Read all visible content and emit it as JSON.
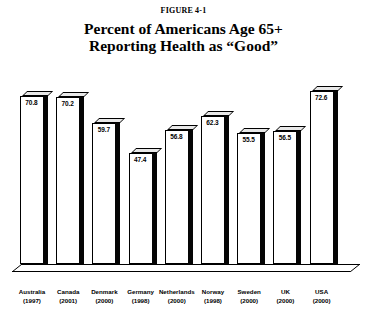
{
  "figure": {
    "caption": "FIGURE 4-1"
  },
  "title": {
    "line1": "Percent of Americans Age 65+",
    "line2": "Reporting Health as “Good”"
  },
  "chart_data": {
    "type": "bar",
    "title": "Percent of Americans Age 65+ Reporting Health as “Good”",
    "subtitle": "FIGURE 4-1",
    "xlabel": "",
    "ylabel": "",
    "ylim": [
      0,
      80
    ],
    "grid": false,
    "legend": "none",
    "value_labels": true,
    "categories": [
      "Australia (1997)",
      "Canada (2001)",
      "Denmark (2000)",
      "Germany (1998)",
      "Netherlands (2000)",
      "Norway (1998)",
      "Sweden (2000)",
      "UK (2000)",
      "USA (2000)"
    ],
    "values": [
      70.8,
      70.2,
      59.7,
      47.4,
      56.8,
      62.3,
      55.5,
      56.5,
      72.6
    ],
    "points": [
      {
        "country": "Australia",
        "year": "(1997)",
        "value": 70.8,
        "label": "70.8"
      },
      {
        "country": "Canada",
        "year": "(2001)",
        "value": 70.2,
        "label": "70.2"
      },
      {
        "country": "Denmark",
        "year": "(2000)",
        "value": 59.7,
        "label": "59.7"
      },
      {
        "country": "Germany",
        "year": "(1998)",
        "value": 47.4,
        "label": "47.4"
      },
      {
        "country": "Netherlands",
        "year": "(2000)",
        "value": 56.8,
        "label": "56.8"
      },
      {
        "country": "Norway",
        "year": "(1998)",
        "value": 62.3,
        "label": "62.3"
      },
      {
        "country": "Sweden",
        "year": "(2000)",
        "value": 55.5,
        "label": "55.5"
      },
      {
        "country": "UK",
        "year": "(2000)",
        "value": 56.5,
        "label": "56.5"
      },
      {
        "country": "USA",
        "year": "(2000)",
        "value": 72.6,
        "label": "72.6"
      }
    ],
    "colors": {
      "bar_front": "#ffffff",
      "bar_side": "#050505",
      "bar_top": "#e8e8e8",
      "outline": "#000000",
      "background": "#ffffff"
    }
  }
}
